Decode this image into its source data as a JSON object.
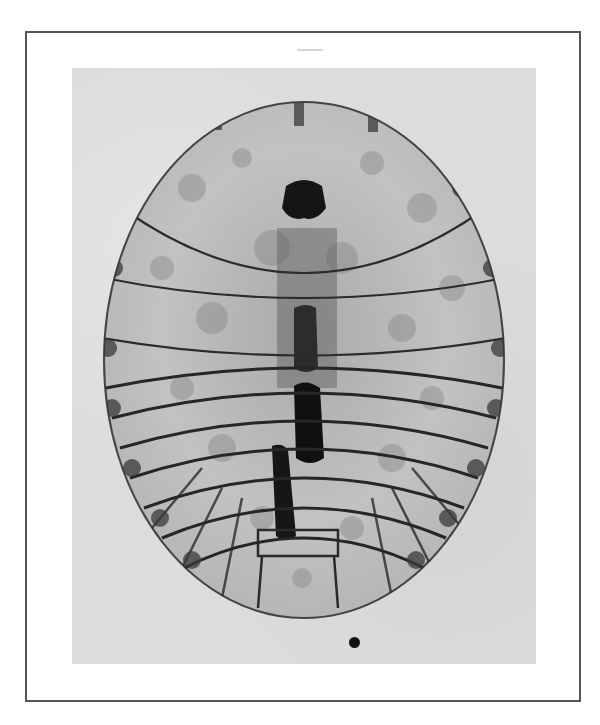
{
  "figure": {
    "colors": {
      "frame_border": "#555555",
      "photo_background": "#dcdcdc",
      "specimen_body": "#bdbdbd",
      "specimen_dark": "#1e1e1e",
      "segment_lines": "#2b2b2b"
    }
  }
}
